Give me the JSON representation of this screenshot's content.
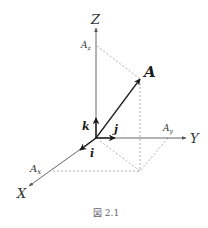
{
  "figure": {
    "caption": "図 2.1",
    "axes": {
      "x_label": "X",
      "y_label": "Y",
      "z_label": "Z"
    },
    "components": {
      "ax": "A",
      "ax_sub": "x",
      "ay": "A",
      "ay_sub": "y",
      "az": "A",
      "az_sub": "z"
    },
    "vector_label": "A",
    "unit_vectors": {
      "i": "i",
      "j": "j",
      "k": "k"
    },
    "colors": {
      "axis": "#555555",
      "vector": "#222222",
      "dashed": "#999999",
      "caption": "#666666"
    }
  }
}
